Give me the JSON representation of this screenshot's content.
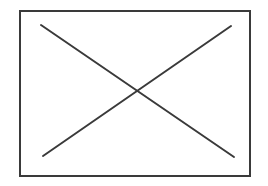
{
  "figure": {
    "name": "crossed-rectangle",
    "canvas": {
      "width": 268,
      "height": 186,
      "background_color": "#ffffff"
    },
    "shapes": {
      "rectangle": {
        "label": "rectangle-outline",
        "x": 20,
        "y": 10.5,
        "width": 230,
        "height": 165,
        "stroke_color": "#3a3a3a",
        "stroke_width": 2,
        "fill": "none"
      },
      "diagonal_down": {
        "label": "diagonal-line-descending",
        "x1": 41,
        "y1": 25,
        "x2": 234,
        "y2": 157,
        "stroke_color": "#3a3a3a",
        "stroke_width": 2
      },
      "diagonal_up": {
        "label": "diagonal-line-ascending",
        "x1": 43,
        "y1": 156,
        "x2": 231,
        "y2": 26,
        "stroke_color": "#3a3a3a",
        "stroke_width": 2
      }
    },
    "intersection": {
      "label": "diagonal-intersection-point",
      "x": 136,
      "y": 92
    }
  }
}
